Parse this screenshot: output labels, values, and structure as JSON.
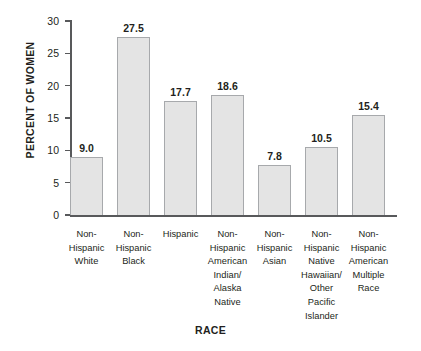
{
  "chart_data": {
    "type": "bar",
    "title": "",
    "xlabel": "RACE",
    "ylabel": "PERCENT OF WOMEN",
    "ylim": [
      0,
      30
    ],
    "yticks": [
      0,
      5,
      10,
      15,
      20,
      25,
      30
    ],
    "ytick_labels": [
      "0",
      "5",
      "10",
      "15",
      "20",
      "25",
      "30"
    ],
    "grid": false,
    "legend": null,
    "categories": [
      "Non-Hispanic White",
      "Non-Hispanic Black",
      "Hispanic",
      "Non-Hispanic American Indian/ Alaska Native",
      "Non-Hispanic Asian",
      "Non-Hispanic Native Hawaiian/ Other Pacific Islander",
      "Non-Hispanic American Multiple Race"
    ],
    "category_lines": [
      [
        "Non-",
        "Hispanic",
        "White"
      ],
      [
        "Non-",
        "Hispanic",
        "Black"
      ],
      [
        "Hispanic"
      ],
      [
        "Non-",
        "Hispanic",
        "American",
        "Indian/",
        "Alaska",
        "Native"
      ],
      [
        "Non-",
        "Hispanic",
        "Asian"
      ],
      [
        "Non-",
        "Hispanic",
        "Native",
        "Hawaiian/",
        "Other",
        "Pacific",
        "Islander"
      ],
      [
        "Non-",
        "Hispanic",
        "American",
        "Multiple",
        "Race"
      ]
    ],
    "values": [
      9.0,
      27.5,
      17.7,
      18.6,
      7.8,
      10.5,
      15.4
    ],
    "value_labels": [
      "9.0",
      "27.5",
      "17.7",
      "18.6",
      "7.8",
      "10.5",
      "15.4"
    ],
    "colors": {
      "bar_fill": "#e4e4e4",
      "bar_border": "#a7a9ac",
      "axis": "#58595b",
      "text": "#231f20",
      "background": "#ffffff"
    }
  }
}
